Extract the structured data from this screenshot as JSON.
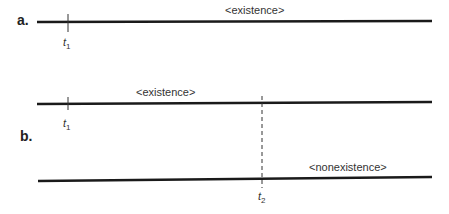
{
  "panels": {
    "a": {
      "label": "a.",
      "line_label": "<existence>",
      "time_marker": {
        "t": "t",
        "sub": "1"
      }
    },
    "b": {
      "label": "b.",
      "top_line_label": "<existence>",
      "bottom_line_label": "<nonexistence>",
      "time_marker_1": {
        "t": "t",
        "sub": "1"
      },
      "time_marker_2": {
        "t": "t",
        "sub": "2"
      }
    }
  },
  "colors": {
    "line": "#1a1a1a",
    "text": "#333333"
  }
}
